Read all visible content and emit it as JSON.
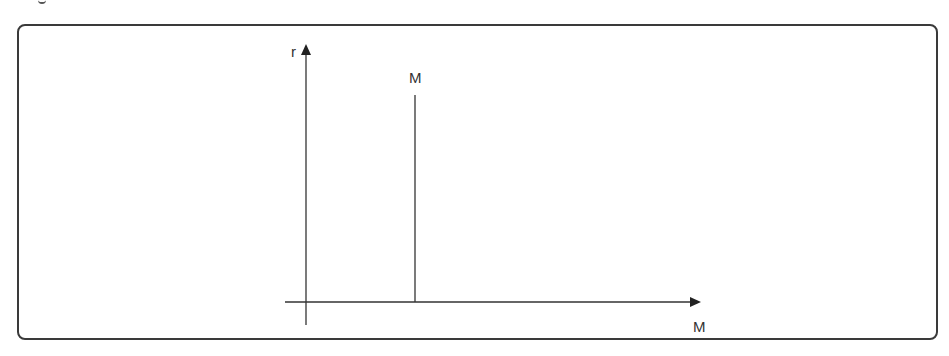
{
  "diagram": {
    "y_axis_label": "r",
    "x_axis_label": "M",
    "vertical_line_label": "M",
    "colors": {
      "line": "#333333",
      "frame": "#3a3a3a",
      "background": "#ffffff"
    }
  }
}
